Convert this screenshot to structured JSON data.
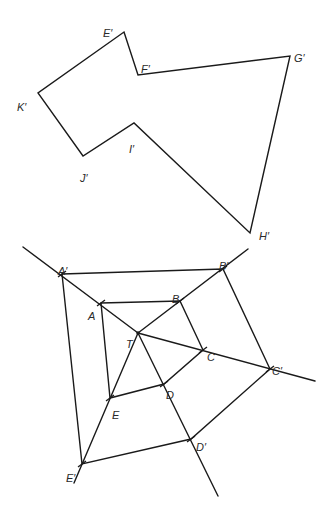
{
  "diagram": {
    "stroke_color": "#1a1a1a",
    "background": "#ffffff",
    "top_polygon": {
      "name": "Image polygon E'F'G'H'I'J'K'",
      "vertices": [
        {
          "label": "E′",
          "x": 124,
          "y": 32,
          "lx": 103,
          "ly": 29
        },
        {
          "label": "F′",
          "x": 138,
          "y": 75,
          "lx": 141,
          "ly": 65
        },
        {
          "label": "G′",
          "x": 290,
          "y": 56,
          "lx": 294,
          "ly": 54
        },
        {
          "label": "H′",
          "x": 250,
          "y": 233,
          "lx": 259,
          "ly": 232
        },
        {
          "label": "I′",
          "x": 134,
          "y": 123,
          "lx": 129,
          "ly": 145
        },
        {
          "label": "J′",
          "x": 83,
          "y": 156,
          "lx": 80,
          "ly": 174
        },
        {
          "label": "K′",
          "x": 38,
          "y": 93,
          "lx": 17,
          "ly": 103
        }
      ]
    },
    "bottom_figure": {
      "center": {
        "label": "T",
        "x": 138,
        "y": 333,
        "lx": 126,
        "ly": 340
      },
      "original": [
        {
          "label": "A",
          "x": 101,
          "y": 303,
          "lx": 88,
          "ly": 312
        },
        {
          "label": "B",
          "x": 180,
          "y": 301,
          "lx": 172,
          "ly": 295
        },
        {
          "label": "C",
          "x": 203,
          "y": 350,
          "lx": 207,
          "ly": 353
        },
        {
          "label": "D",
          "x": 164,
          "y": 384,
          "lx": 166,
          "ly": 391
        },
        {
          "label": "E",
          "x": 110,
          "y": 398,
          "lx": 112,
          "ly": 411
        }
      ],
      "image": [
        {
          "label": "A′",
          "x": 62,
          "y": 274,
          "lx": 58,
          "ly": 267
        },
        {
          "label": "B′",
          "x": 223,
          "y": 269,
          "lx": 219,
          "ly": 262
        },
        {
          "label": "C′",
          "x": 270,
          "y": 369,
          "lx": 272,
          "ly": 367
        },
        {
          "label": "D′",
          "x": 191,
          "y": 439,
          "lx": 196,
          "ly": 443
        },
        {
          "label": "E′",
          "x": 82,
          "y": 464,
          "lx": 66,
          "ly": 474
        }
      ],
      "rays": [
        {
          "from": "T",
          "x1": 138,
          "y1": 333,
          "x2": 23,
          "y2": 247
        },
        {
          "from": "T",
          "x1": 138,
          "y1": 333,
          "x2": 248,
          "y2": 249
        },
        {
          "from": "T",
          "x1": 138,
          "y1": 333,
          "x2": 315,
          "y2": 381
        },
        {
          "from": "T",
          "x1": 138,
          "y1": 333,
          "x2": 218,
          "y2": 496
        },
        {
          "from": "T",
          "x1": 138,
          "y1": 333,
          "x2": 74,
          "y2": 483
        }
      ]
    }
  }
}
